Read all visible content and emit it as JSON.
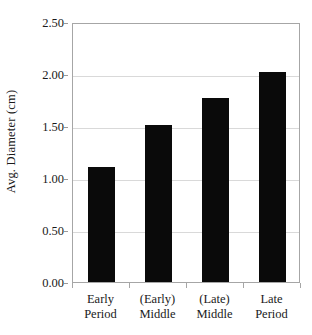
{
  "chart_data": {
    "type": "bar",
    "title": "",
    "xlabel": "",
    "ylabel": "Avg. Diameter (cm)",
    "categories": [
      "Early Period",
      "(Early) Middle",
      "(Late) Middle",
      "Late Period"
    ],
    "category_lines": [
      [
        "Early",
        "Period"
      ],
      [
        "(Early)",
        "Middle"
      ],
      [
        "(Late)",
        "Middle"
      ],
      [
        "Late",
        "Period"
      ]
    ],
    "values": [
      1.11,
      1.51,
      1.77,
      2.02
    ],
    "ylim": [
      0.0,
      2.5
    ],
    "ytick_values": [
      0.0,
      0.5,
      1.0,
      1.5,
      2.0,
      2.5
    ],
    "ytick_labels": [
      "0.00",
      "0.50",
      "1.00",
      "1.50",
      "2.00",
      "2.50"
    ],
    "grid": true,
    "grid_axis": "y",
    "legend": false,
    "legend_position": "none",
    "bar_color": "#0a0a0a",
    "grid_color": "#d9d9d9",
    "axis_color": "#a6a6a6",
    "text_color": "#1a1a1a",
    "background": "#ffffff"
  }
}
